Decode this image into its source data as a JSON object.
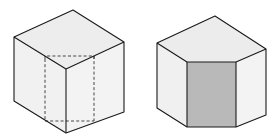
{
  "figures": [
    {
      "name": "cube-with-hidden-prism",
      "description": "Isometric cube with dashed hidden edges of an inner rectangular prism",
      "colors": {
        "top": "#ededed",
        "left": "#f1f1f1",
        "right": "#f3f3f3",
        "edge": "#1a1a1a"
      }
    },
    {
      "name": "cube-with-prism-cut-out",
      "description": "Isometric cube with front corner removed, exposing a shaded rectangular face",
      "colors": {
        "top": "#ececec",
        "left": "#f0f0f0",
        "right": "#f3f3f3",
        "cut_face": "#b9b9b9",
        "edge": "#1a1a1a"
      }
    }
  ]
}
